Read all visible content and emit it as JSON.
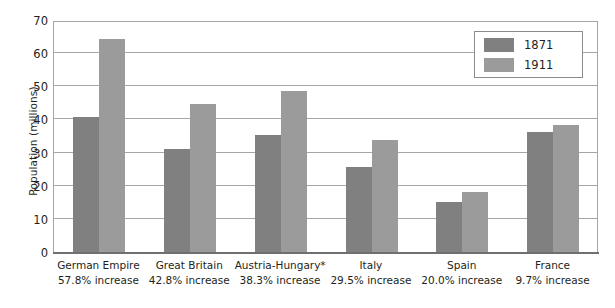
{
  "chart_data": {
    "type": "bar",
    "title": "",
    "subtitle": "",
    "xlabel": "",
    "ylabel": "Population (millions)",
    "ylim": [
      0,
      70
    ],
    "ytick_step": 10,
    "yticks": [
      0,
      10,
      20,
      30,
      40,
      50,
      60,
      70
    ],
    "grid": true,
    "grid_axis": "y",
    "legend_position": "top-right",
    "categories": [
      "German Empire",
      "Great Britain",
      "Austria-Hungary*",
      "Italy",
      "Spain",
      "France"
    ],
    "category_notes": [
      "57.8% increase",
      "42.8% increase",
      "38.3% increase",
      "29.5% increase",
      "20.0% increase",
      "9.7% increase"
    ],
    "series": [
      {
        "name": "1871",
        "color": "#808080",
        "values": [
          41,
          31.5,
          35.5,
          26,
          15.5,
          36.5
        ]
      },
      {
        "name": "1911",
        "color": "#9b9b9b",
        "values": [
          64.5,
          45,
          49,
          34,
          18.5,
          38.5
        ]
      }
    ]
  },
  "colors": {
    "series_1871": "#808080",
    "series_1911": "#9b9b9b",
    "gridline": "#a6a6a6",
    "axis": "#6f6f6f",
    "text": "#231f20",
    "background": "#ffffff"
  }
}
